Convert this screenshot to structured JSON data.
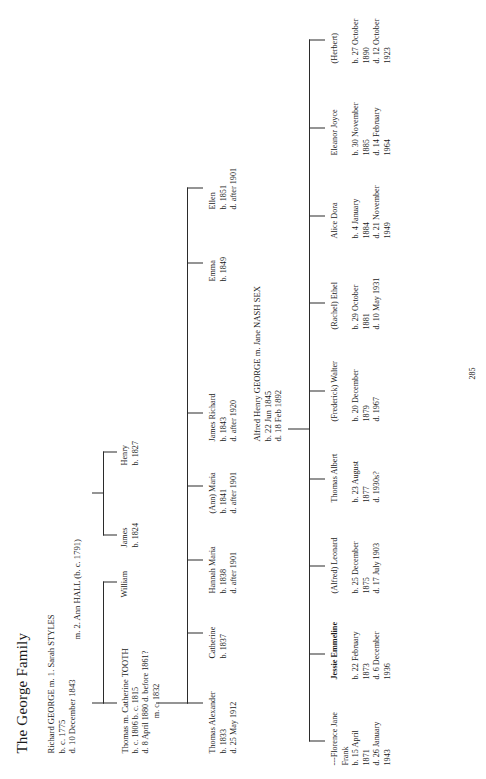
{
  "document": {
    "title": "The George Family",
    "page_number": "285"
  },
  "generation1": {
    "couple": "Richard GEORGE  m. 1. Sarah STYLES",
    "birth": "b. c. 1775",
    "death": "d. 10 December 1843",
    "second_marriage": "m. 2. Ann HALL (b. c. 1791)"
  },
  "generation2": [
    {
      "name": "Thomas  m. Catherine TOOTH",
      "lines": [
        "b. c. 1806          b. c. 1815",
        "d. 8 April 1880   d. before 1861?",
        "m. c. 1832"
      ]
    },
    {
      "name": "William",
      "lines": []
    },
    {
      "name": "James",
      "lines": [
        "b. 1824"
      ]
    },
    {
      "name": "Henry",
      "lines": [
        "b. 1827"
      ]
    }
  ],
  "generation3": [
    {
      "name": "Thomas Alexander",
      "lines": [
        "b. 1833",
        "d. 25 May 1912"
      ]
    },
    {
      "name": "Catherine",
      "lines": [
        "b. 1837"
      ]
    },
    {
      "name": "Hannah Maria",
      "lines": [
        "b. 1838",
        "d. after 1901"
      ]
    },
    {
      "name": "(Ann) Maria",
      "lines": [
        "b. 1841",
        "d. after 1901"
      ]
    },
    {
      "name": "James Richard",
      "lines": [
        "b. 1843",
        "d. after 1920"
      ]
    },
    {
      "name": "Emma",
      "lines": [
        "b. 1849"
      ]
    },
    {
      "name": "Ellen",
      "lines": [
        "b. 1851",
        "d. after 1901"
      ]
    }
  ],
  "generation4_couple": {
    "name": "Alfred Henry GEORGE  m. Jane NASH SEX",
    "birth": "b. 22 Jun 1845",
    "death": "d. 18 Feb 1892"
  },
  "generation5": [
    {
      "name": "---Florence Jane",
      "name2": "Frank",
      "bold": false,
      "lines": [
        "b. 15 April",
        "1871",
        "d. 26 January",
        "1943"
      ]
    },
    {
      "name": "Jessie Emmeline",
      "name2": "",
      "bold": true,
      "lines": [
        "b. 22 February",
        "1873",
        "d. 6 December",
        "1936"
      ]
    },
    {
      "name": "(Alfred) Leonard",
      "name2": "",
      "bold": false,
      "lines": [
        "b. 25 December",
        "1875",
        "d. 17 July 1903"
      ]
    },
    {
      "name": "Thomas Albert",
      "name2": "",
      "bold": false,
      "lines": [
        "b. 23 August",
        "1877",
        "d. 1930s?"
      ]
    },
    {
      "name": "(Frederick) Walter",
      "name2": "",
      "bold": false,
      "lines": [
        "b. 20 December",
        "1879",
        "d. 1967"
      ]
    },
    {
      "name": "(Rachel) Ethel",
      "name2": "",
      "bold": false,
      "lines": [
        "b. 29 October",
        "1881",
        "d. 10 May 1931"
      ]
    },
    {
      "name": "Alice Dora",
      "name2": "",
      "bold": false,
      "lines": [
        "b. 4 January",
        "1884",
        "d. 21 November",
        "1949"
      ]
    },
    {
      "name": "Eleanor Joyce",
      "name2": "",
      "bold": false,
      "lines": [
        "b. 30 November",
        "1885",
        "d. 14 February",
        "1964"
      ]
    },
    {
      "name": "(Herbert)",
      "name2": "",
      "bold": false,
      "lines": [
        "b. 27 October",
        "1890",
        "d. 12 October",
        "1923"
      ]
    }
  ],
  "colors": {
    "ink": "#1a1a1a",
    "rule": "#2b2b2b",
    "paper": "#ffffff"
  }
}
